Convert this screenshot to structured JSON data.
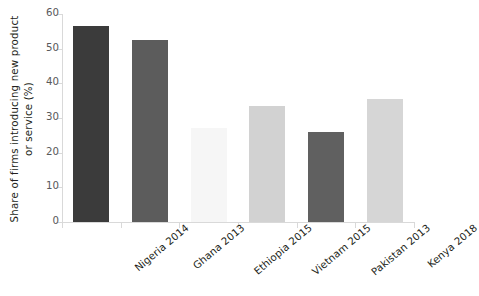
{
  "chart_data": {
    "type": "bar",
    "title": "",
    "subtitle": "",
    "xlabel": "",
    "ylabel": "Share of firms introducing new product\nor service (%)",
    "categories": [
      "Nigeria 2014",
      "Ghana 2013",
      "Ethiopia  2015",
      "Vietnam 2015",
      "Pakistan 2013",
      "Kenya 2018"
    ],
    "values": [
      56.5,
      52.5,
      27,
      33.5,
      26,
      35.5
    ],
    "ylim": [
      0,
      60
    ],
    "yticks": [
      0,
      10,
      20,
      30,
      40,
      50,
      60
    ],
    "ytick_labels": [
      "0",
      "10",
      "20",
      "30",
      "40",
      "50",
      "60"
    ],
    "grid": false,
    "legend": "none",
    "bar_colors": [
      "#3b3b3b",
      "#5c5c5c",
      "#f6f6f6",
      "#d2d2d2",
      "#606060",
      "#d6d6d6"
    ],
    "axis_color": "#d9d9d9",
    "text_color": "#231f20",
    "tick_label_color": "#58595b",
    "background": "#ffffff"
  }
}
